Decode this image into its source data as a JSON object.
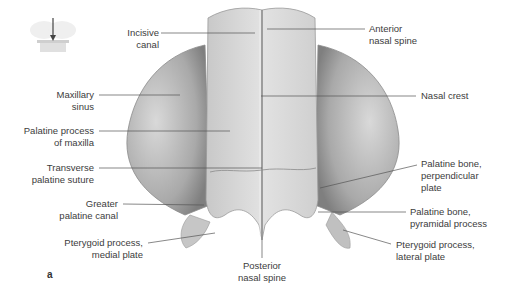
{
  "figure": {
    "panel_letter": "a",
    "orientation_icon": "skull-orientation-arrow-icon",
    "colors": {
      "background": "#ffffff",
      "bone_light": "#e6e6e6",
      "bone_mid": "#bdbdbd",
      "bone_dark": "#8a8a8a",
      "leader_line": "#555555",
      "label_text": "#3c3c3c"
    },
    "labels": {
      "incisive_canal": "Incisive\ncanal",
      "anterior_nasal_spine": "Anterior\nnasal spine",
      "maxillary_sinus": "Maxillary\nsinus",
      "nasal_crest": "Nasal crest",
      "palatine_process_of_maxilla": "Palatine process\nof maxilla",
      "transverse_palatine_suture": "Transverse\npalatine suture",
      "palatine_bone_perpendicular_plate": "Palatine bone,\nperpendicular\nplate",
      "greater_palatine_canal": "Greater\npalatine canal",
      "palatine_bone_pyramidal_process": "Palatine bone,\npyramidal process",
      "pterygoid_process_medial_plate": "Pterygoid process,\nmedial plate",
      "posterior_nasal_spine": "Posterior\nnasal spine",
      "pterygoid_process_lateral_plate": "Pterygoid process,\nlateral plate"
    }
  }
}
